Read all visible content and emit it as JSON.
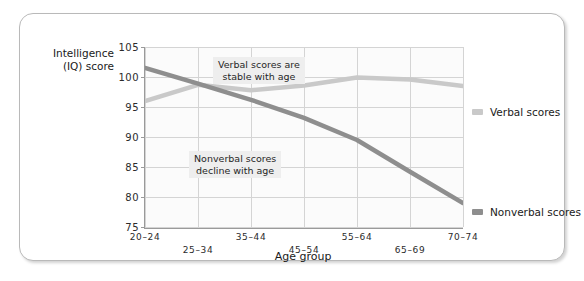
{
  "chart_data": {
    "type": "line",
    "title": "",
    "xlabel": "Age group",
    "ylabel": "Intelligence (IQ) score",
    "ylabel_line1": "Intelligence",
    "ylabel_line2": "(IQ) score",
    "categories": [
      "20–24",
      "25–34",
      "35–44",
      "45–54",
      "55–64",
      "65–69",
      "70–74"
    ],
    "ylim": [
      75,
      105
    ],
    "yticks": [
      75,
      80,
      85,
      90,
      95,
      100,
      105
    ],
    "grid": true,
    "legend_position": "right",
    "series": [
      {
        "name": "Verbal scores",
        "color": "#c9c9c9",
        "values": [
          96.0,
          98.7,
          97.8,
          98.6,
          99.9,
          99.6,
          98.5
        ]
      },
      {
        "name": "Nonverbal scores",
        "color": "#8e8e8e",
        "values": [
          101.5,
          98.9,
          96.2,
          93.2,
          89.5,
          84.2,
          79.0
        ]
      }
    ],
    "annotations": [
      {
        "text_line1": "Verbal scores are",
        "text_line2": "stable with age"
      },
      {
        "text_line1": "Nonverbal scores",
        "text_line2": "decline with age"
      }
    ]
  },
  "legend": {
    "items": [
      {
        "label": "Verbal scores"
      },
      {
        "label": "Nonverbal scores"
      }
    ]
  }
}
